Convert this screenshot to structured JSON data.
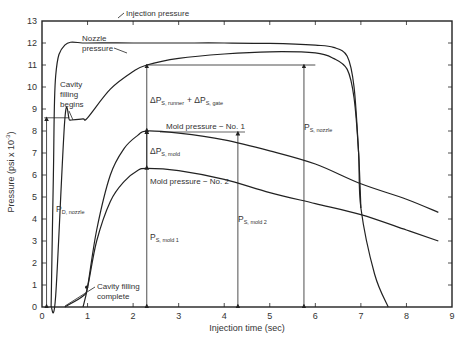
{
  "chart_data": {
    "type": "line",
    "title": "",
    "xlabel": "Injection time (sec)",
    "ylabel": "Pressure (psi x 10^-3)",
    "ylabel_parts": {
      "main": "Pressure (psi x 10",
      "sup": "-3",
      "close": ")"
    },
    "xlim": [
      0,
      9
    ],
    "ylim": [
      0,
      13
    ],
    "grid": false,
    "x_ticks": [
      "0",
      "1",
      "2",
      "3",
      "4",
      "5",
      "6",
      "7",
      "8",
      "9"
    ],
    "y_ticks": [
      "0",
      "1",
      "2",
      "3",
      "4",
      "5",
      "6",
      "7",
      "8",
      "9",
      "10",
      "11",
      "12",
      "13"
    ],
    "series": [
      {
        "name": "Injection pressure",
        "x": [
          0.2,
          0.25,
          0.3,
          0.5,
          1,
          2,
          3,
          4,
          5,
          6,
          6.4,
          6.7,
          6.85,
          6.95,
          7.0
        ],
        "y": [
          0,
          6,
          10.5,
          11.9,
          12.0,
          12.0,
          12.0,
          12.0,
          11.98,
          11.9,
          11.8,
          11.4,
          10,
          7,
          4.5
        ]
      },
      {
        "name": "Nozzle pressure",
        "x": [
          0.2,
          0.3,
          0.5,
          0.6,
          0.65,
          0.9,
          1.0,
          1.5,
          2,
          2.3,
          3,
          4,
          5,
          6,
          6.4,
          6.7,
          6.85,
          6.95,
          7.0,
          7.3,
          7.6
        ],
        "y": [
          0,
          0.5,
          8.5,
          8.5,
          8.5,
          8.55,
          8.6,
          9.9,
          10.7,
          11.0,
          11.3,
          11.5,
          11.6,
          11.55,
          11.3,
          10.8,
          9.5,
          7,
          4.5,
          1.5,
          0
        ]
      },
      {
        "name": "Mold pressure - No. 1",
        "x": [
          0.9,
          1.0,
          1.2,
          1.5,
          1.8,
          2.1,
          2.3,
          3,
          4,
          5,
          6,
          7,
          8,
          8.7
        ],
        "y": [
          0,
          0.9,
          3.5,
          6,
          7.2,
          7.8,
          8.0,
          7.9,
          7.6,
          7.1,
          6.5,
          5.6,
          4.9,
          4.3
        ]
      },
      {
        "name": "Mold pressure - No. 2",
        "x": [
          0.5,
          0.9,
          1.0,
          1.2,
          1.5,
          1.8,
          2.1,
          2.3,
          3,
          4,
          5,
          6,
          7,
          8,
          8.7
        ],
        "y": [
          0,
          0.5,
          0.9,
          3,
          4.8,
          5.7,
          6.2,
          6.3,
          6.2,
          5.8,
          5.2,
          4.7,
          4.2,
          3.5,
          3.0
        ]
      }
    ],
    "annotations": [
      {
        "text": "Injection pressure",
        "x": 1.6,
        "y": 12.4
      },
      {
        "text": "Nozzle pressure",
        "x": 1.3,
        "y": 10.9
      },
      {
        "text": "Cavity filling begins",
        "x": 0.45,
        "y": 10.3
      },
      {
        "text": "Cavity filling complete",
        "x": 1.3,
        "y": 1.2
      },
      {
        "text": "ΔP_S,runner + ΔP_S,gate",
        "x": 2.35,
        "y": 9.0
      },
      {
        "text": "Mold pressure - No. 1",
        "x": 2.5,
        "y": 8.3
      },
      {
        "text": "ΔP_S,mold",
        "x": 2.35,
        "y": 7.2
      },
      {
        "text": "Mold pressure - No. 2",
        "x": 2.35,
        "y": 5.6
      },
      {
        "text": "P_D,nozzle",
        "x": 0.3,
        "y": 4.6
      },
      {
        "text": "P_S,mold 1",
        "x": 2.35,
        "y": 3.6
      },
      {
        "text": "P_S,mold 2",
        "x": 4.35,
        "y": 4.0
      },
      {
        "text": "P_S,nozzle",
        "x": 5.85,
        "y": 7.0
      }
    ],
    "markers": [
      {
        "name": "P_D,nozzle arrow",
        "x": 0.1,
        "y_from": 0,
        "y_to": 8.6
      },
      {
        "name": "P_S,mold 1 arrow",
        "x": 2.3,
        "y_from": 0,
        "y_to": 8.0
      },
      {
        "name": "P_S,mold 2 arrow",
        "x": 4.3,
        "y_from": 0,
        "y_to": 7.95
      },
      {
        "name": "P_S,nozzle arrow",
        "x": 5.75,
        "y_from": 0,
        "y_to": 11.0
      }
    ]
  },
  "labels": {
    "injection": "Injection pressure",
    "nozzle_1": "Nozzle",
    "nozzle_2": "pressure",
    "cfb_1": "Cavity",
    "cfb_2": "filling",
    "cfb_3": "begins",
    "cfc_1": "Cavity filling",
    "cfc_2": "complete",
    "mold1": "Mold pressure − No. 1",
    "mold2": "Mold pressure − No. 2",
    "dp_main_a": "ΔP",
    "dp_sub_a": "S, runner",
    "dp_plus": "+ ΔP",
    "dp_sub_b": "S, gate",
    "dpmold_main": "ΔP",
    "dpmold_sub": "S, mold",
    "pd_main": "P",
    "pd_sub": "D, nozzle",
    "ps1_main": "P",
    "ps1_sub": "S, mold 1",
    "ps2_main": "P",
    "ps2_sub": "S, mold 2",
    "psn_main": "P",
    "psn_sub": "S, nozzle"
  }
}
